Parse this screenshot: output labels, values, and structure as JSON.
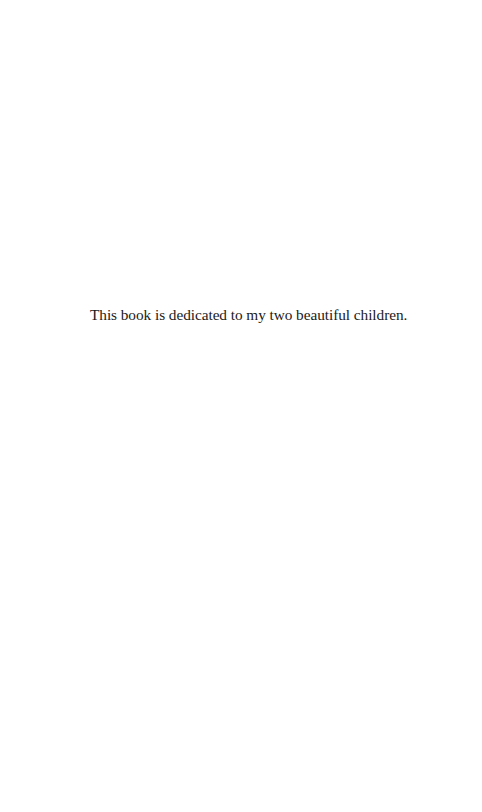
{
  "page": {
    "dedication_text": "This book is dedicated to my two beautiful children."
  }
}
